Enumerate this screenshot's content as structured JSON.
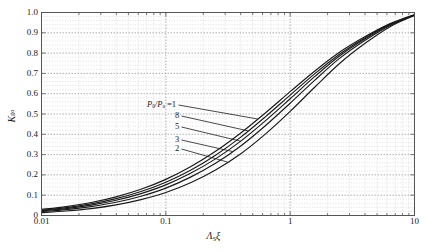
{
  "chart_data": {
    "type": "line",
    "title": "",
    "xlabel": "ΛSξ",
    "xlabel_parts": {
      "lambda": "Λ",
      "sub": "S",
      "xi": "ξ"
    },
    "ylabel": "Kgo",
    "ylabel_parts": {
      "main": "K",
      "sub": "go"
    },
    "xscale": "log",
    "yscale": "linear",
    "xlim": [
      0.01,
      10
    ],
    "ylim": [
      0,
      1.0
    ],
    "grid": true,
    "grid_style": "dotted",
    "legend_position": "inline-annotations",
    "xticks": [
      "0.01",
      "0.1",
      "1",
      "10"
    ],
    "xtick_values": [
      0.01,
      0.1,
      1,
      10
    ],
    "yticks": [
      "0",
      "0.1",
      "0.2",
      "0.3",
      "0.4",
      "0.5",
      "0.6",
      "0.7",
      "0.8",
      "0.9",
      "1.0"
    ],
    "ytick_values": [
      0,
      0.1,
      0.2,
      0.3,
      0.4,
      0.5,
      0.6,
      0.7,
      0.8,
      0.9,
      1.0
    ],
    "series": [
      {
        "name": "1",
        "label": "P0/Pa =1",
        "x": [
          0.01,
          0.0158,
          0.0251,
          0.0398,
          0.0631,
          0.1,
          0.158,
          0.251,
          0.398,
          0.631,
          1.0,
          1.58,
          2.51,
          3.98,
          6.31,
          10.0
        ],
        "values": [
          0.03,
          0.044,
          0.064,
          0.092,
          0.129,
          0.178,
          0.24,
          0.316,
          0.405,
          0.505,
          0.61,
          0.712,
          0.805,
          0.88,
          0.944,
          0.99
        ]
      },
      {
        "name": "8",
        "label": "8",
        "x": [
          0.01,
          0.0158,
          0.0251,
          0.0398,
          0.0631,
          0.1,
          0.158,
          0.251,
          0.398,
          0.631,
          1.0,
          1.58,
          2.51,
          3.98,
          6.31,
          10.0
        ],
        "values": [
          0.026,
          0.039,
          0.057,
          0.083,
          0.118,
          0.164,
          0.223,
          0.297,
          0.385,
          0.486,
          0.593,
          0.699,
          0.796,
          0.875,
          0.941,
          0.989
        ]
      },
      {
        "name": "5",
        "label": "5",
        "x": [
          0.01,
          0.0158,
          0.0251,
          0.0398,
          0.0631,
          0.1,
          0.158,
          0.251,
          0.398,
          0.631,
          1.0,
          1.58,
          2.51,
          3.98,
          6.31,
          10.0
        ],
        "values": [
          0.023,
          0.034,
          0.051,
          0.075,
          0.108,
          0.151,
          0.208,
          0.279,
          0.365,
          0.466,
          0.575,
          0.685,
          0.787,
          0.869,
          0.938,
          0.988
        ]
      },
      {
        "name": "3",
        "label": "3",
        "x": [
          0.01,
          0.0158,
          0.0251,
          0.0398,
          0.0631,
          0.1,
          0.158,
          0.251,
          0.398,
          0.631,
          1.0,
          1.58,
          2.51,
          3.98,
          6.31,
          10.0
        ],
        "values": [
          0.019,
          0.029,
          0.044,
          0.065,
          0.095,
          0.135,
          0.189,
          0.257,
          0.341,
          0.442,
          0.553,
          0.667,
          0.775,
          0.862,
          0.935,
          0.987
        ]
      },
      {
        "name": "2",
        "label": "2",
        "x": [
          0.01,
          0.0158,
          0.0251,
          0.0398,
          0.0631,
          0.1,
          0.158,
          0.251,
          0.398,
          0.631,
          1.0,
          1.58,
          2.51,
          3.98,
          6.31,
          10.0
        ],
        "values": [
          0.014,
          0.022,
          0.034,
          0.052,
          0.078,
          0.113,
          0.161,
          0.224,
          0.303,
          0.401,
          0.513,
          0.633,
          0.75,
          0.847,
          0.929,
          0.985
        ]
      }
    ],
    "annotations": [
      {
        "text": "P0/Pa =1",
        "is_primary": true
      },
      {
        "text": "8",
        "is_primary": false
      },
      {
        "text": "5",
        "is_primary": false
      },
      {
        "text": "3",
        "is_primary": false
      },
      {
        "text": "2",
        "is_primary": false
      }
    ],
    "colors": {
      "curve": "#1a1a1a",
      "grid": "#bdbdbd",
      "axis": "#4d4d4d",
      "background": "#ffffff"
    }
  }
}
